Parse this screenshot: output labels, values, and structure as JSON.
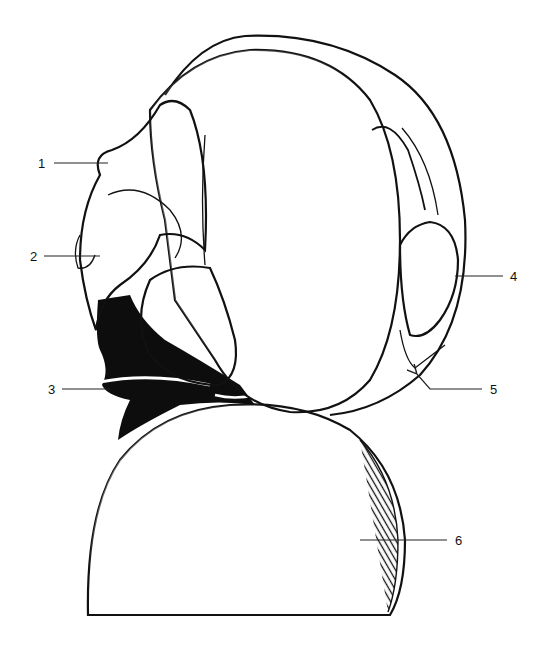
{
  "figure": {
    "title": "",
    "background": "#ffffff",
    "ink_color": "#111111",
    "labels": [
      {
        "id": "1",
        "text": "1",
        "x": 38,
        "y": 157,
        "line": [
          [
            54,
            163
          ],
          [
            108,
            163
          ]
        ]
      },
      {
        "id": "2",
        "text": "2",
        "x": 30,
        "y": 250,
        "line": [
          [
            44,
            256
          ],
          [
            100,
            256
          ]
        ]
      },
      {
        "id": "3",
        "text": "3",
        "x": 48,
        "y": 383,
        "line": [
          [
            62,
            389
          ],
          [
            110,
            389
          ]
        ]
      },
      {
        "id": "4",
        "text": "4",
        "x": 510,
        "y": 270,
        "line": [
          [
            455,
            276
          ],
          [
            503,
            276
          ]
        ]
      },
      {
        "id": "5",
        "text": "5",
        "x": 490,
        "y": 383,
        "line": [
          [
            482,
            389
          ],
          [
            430,
            389
          ],
          [
            416,
            373
          ]
        ],
        "arrow": true
      },
      {
        "id": "6",
        "text": "6",
        "x": 455,
        "y": 534,
        "line": [
          [
            360,
            540
          ],
          [
            447,
            540
          ]
        ]
      }
    ]
  }
}
